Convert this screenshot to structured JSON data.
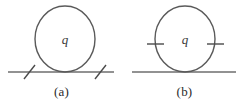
{
  "figure": {
    "type": "feynman-loop-diagrams",
    "background_color": "#ffffff",
    "stroke_color": "#5a5a5a",
    "line_color": "#6e6e6e",
    "text_color": "#2b2b2b",
    "panels": [
      {
        "id": "a",
        "caption": "(a)",
        "loop_label": "q",
        "loop": {
          "shape": "ellipse",
          "cx": 65,
          "cy": 39,
          "rx": 30,
          "ry": 33
        },
        "base_line": {
          "x1": 8,
          "x2": 114,
          "y": 72
        },
        "ticks": [
          {
            "on": "base-line",
            "x": 29,
            "y": 72,
            "orientation": "slanted"
          },
          {
            "on": "base-line",
            "x": 100,
            "y": 72,
            "orientation": "slanted"
          }
        ]
      },
      {
        "id": "b",
        "caption": "(b)",
        "loop_label": "q",
        "loop": {
          "shape": "ellipse",
          "cx": 62,
          "cy": 39,
          "rx": 30,
          "ry": 33
        },
        "base_line": {
          "x1": 9,
          "x2": 113,
          "y": 72
        },
        "ticks": [
          {
            "on": "loop",
            "x": 32,
            "y": 44,
            "orientation": "horizontal"
          },
          {
            "on": "loop",
            "x": 92,
            "y": 44,
            "orientation": "horizontal"
          }
        ]
      }
    ]
  }
}
